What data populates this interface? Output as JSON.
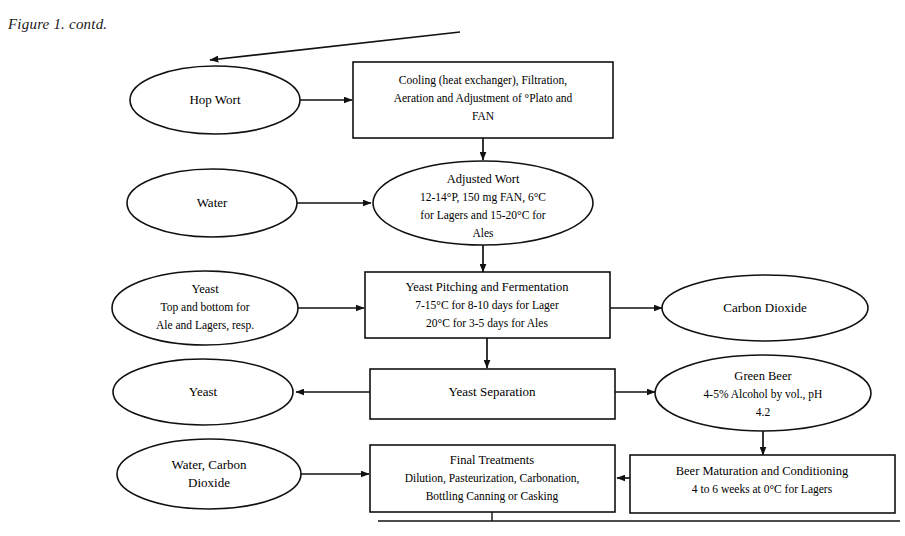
{
  "figure": {
    "caption": "Figure 1. contd."
  },
  "diagram": {
    "type": "flowchart",
    "nodes": [
      {
        "id": "hop-wort",
        "shape": "ellipse",
        "lines": [
          "Hop Wort"
        ]
      },
      {
        "id": "cooling",
        "shape": "rectangle",
        "lines": [
          "Cooling (heat exchanger), Filtration,",
          "Aeration and Adjustment of °Plato and",
          "FAN"
        ]
      },
      {
        "id": "water",
        "shape": "ellipse",
        "lines": [
          "Water"
        ]
      },
      {
        "id": "adjusted-wort",
        "shape": "ellipse",
        "lines": [
          "Adjusted Wort",
          "12-14°P, 150 mg FAN, 6°C",
          "for Lagers and 15-20°C for",
          "Ales"
        ]
      },
      {
        "id": "yeast-input",
        "shape": "ellipse",
        "lines": [
          "Yeast",
          "Top and bottom for",
          "Ale and Lagers, resp."
        ]
      },
      {
        "id": "fermentation",
        "shape": "rectangle",
        "lines": [
          "Yeast Pitching and Fermentation",
          "7-15°C for 8-10 days for Lager",
          "20°C for 3-5 days for Ales"
        ]
      },
      {
        "id": "carbon-dioxide",
        "shape": "ellipse",
        "lines": [
          "Carbon Dioxide"
        ]
      },
      {
        "id": "yeast-output",
        "shape": "ellipse",
        "lines": [
          "Yeast"
        ]
      },
      {
        "id": "yeast-separation",
        "shape": "rectangle",
        "lines": [
          "Yeast Separation"
        ]
      },
      {
        "id": "green-beer",
        "shape": "ellipse",
        "lines": [
          "Green Beer",
          "4-5% Alcohol by vol., pH",
          "4.2"
        ]
      },
      {
        "id": "water-carbon-dioxide",
        "shape": "ellipse",
        "lines": [
          "Water, Carbon",
          "Dioxide"
        ]
      },
      {
        "id": "final-treatments",
        "shape": "rectangle",
        "lines": [
          "Final Treatments",
          "Dilution, Pasteurization, Carbonation,",
          "Bottling Canning or Casking"
        ]
      },
      {
        "id": "beer-maturation",
        "shape": "rectangle",
        "lines": [
          "Beer Maturation and Conditioning",
          "4 to 6 weeks at 0°C for Lagers"
        ]
      }
    ],
    "edges": [
      {
        "from": "offpage-top-right",
        "to": "hop-wort",
        "style": "diagonal-arrow"
      },
      {
        "from": "hop-wort",
        "to": "cooling",
        "style": "arrow-right"
      },
      {
        "from": "cooling",
        "to": "adjusted-wort",
        "style": "arrow-down"
      },
      {
        "from": "water",
        "to": "adjusted-wort",
        "style": "arrow-right"
      },
      {
        "from": "adjusted-wort",
        "to": "fermentation",
        "style": "arrow-down"
      },
      {
        "from": "yeast-input",
        "to": "fermentation",
        "style": "arrow-right"
      },
      {
        "from": "fermentation",
        "to": "carbon-dioxide",
        "style": "arrow-right"
      },
      {
        "from": "fermentation",
        "to": "yeast-separation",
        "style": "arrow-down"
      },
      {
        "from": "yeast-separation",
        "to": "yeast-output",
        "style": "arrow-left"
      },
      {
        "from": "yeast-separation",
        "to": "green-beer",
        "style": "arrow-right"
      },
      {
        "from": "green-beer",
        "to": "beer-maturation",
        "style": "arrow-down"
      },
      {
        "from": "beer-maturation",
        "to": "final-treatments",
        "style": "arrow-left"
      },
      {
        "from": "water-carbon-dioxide",
        "to": "final-treatments",
        "style": "arrow-right"
      },
      {
        "from": "final-treatments",
        "to": "offpage-bottom",
        "style": "stub-down"
      }
    ],
    "colors": {
      "stroke": "#111111",
      "fill": "#ffffff",
      "text": "#000000"
    }
  }
}
